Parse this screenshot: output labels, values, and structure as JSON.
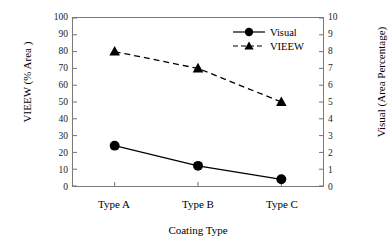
{
  "chart_data": {
    "type": "line",
    "title": "",
    "xlabel": "Coating Type",
    "ylabel": "VIEEW (% Area )",
    "y2label": "Visual (Area Percentage)",
    "categories": [
      "Type A",
      "Type B",
      "Type C"
    ],
    "ylim": [
      0,
      100
    ],
    "y2lim": [
      0,
      10
    ],
    "yticks": [
      0,
      10,
      20,
      30,
      40,
      50,
      60,
      70,
      80,
      90,
      100
    ],
    "y2ticks": [
      0,
      1,
      2,
      3,
      4,
      5,
      6,
      7,
      8,
      9,
      10
    ],
    "ytick_labels": [
      "0",
      "10",
      "20",
      "30",
      "40",
      "50",
      "60",
      "70",
      "80",
      "90",
      "100"
    ],
    "y2tick_labels": [
      "0",
      "1",
      "2",
      "3",
      "4",
      "5",
      "6",
      "7",
      "8",
      "9",
      "10"
    ],
    "grid": false,
    "legend_position": "top-right",
    "series": [
      {
        "name": "Visual",
        "axis": "right",
        "values": [
          2.4,
          1.2,
          0.4
        ],
        "marker": "circle",
        "linestyle": "solid",
        "color": "#000000"
      },
      {
        "name": "VIEEW",
        "axis": "left",
        "values": [
          80,
          70,
          50
        ],
        "marker": "triangle",
        "linestyle": "dashed",
        "color": "#000000"
      }
    ]
  },
  "legend": {
    "items": [
      {
        "label": "Visual",
        "marker": "circle-marker",
        "linestyle": "solid"
      },
      {
        "label": "VIEEW",
        "marker": "triangle-marker",
        "linestyle": "dashed"
      }
    ]
  },
  "axes": {
    "left_title": "VIEEW (% Area )",
    "right_title": "Visual (Area Percentage)",
    "bottom_title": "Coating Type"
  },
  "colors": {
    "ink": "#000000",
    "frame": "#7a7a7a",
    "background": "#ffffff"
  }
}
